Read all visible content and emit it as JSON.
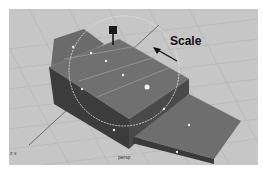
{
  "viewport": {
    "camera_label": "persp",
    "axis_indicator": "z x",
    "background_color": "#c6c6c6",
    "grid_color": "#b4b4b4"
  },
  "annotation": {
    "label": "Scale",
    "icon": "arrow-pointer-icon"
  },
  "manipulator": {
    "type": "scale",
    "handle_icon": "scale-handle-cube-icon",
    "center_icon": "pivot-icon"
  },
  "colors": {
    "mesh_top": "#6e6e6e",
    "mesh_side": "#3e3e3e",
    "mesh_edge": "#9a9a9a",
    "manipulator_ring": "#e0e0e0"
  }
}
